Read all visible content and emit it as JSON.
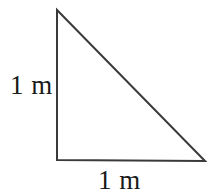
{
  "figure": {
    "kind": "right-triangle-diagram",
    "background_color": "#ffffff",
    "stroke_color": "#3a3a3a",
    "stroke_width": 2,
    "text_color": "#1a1a1a",
    "vertices": {
      "apex": {
        "x": 57,
        "y": 10
      },
      "right_angle": {
        "x": 57,
        "y": 160
      },
      "bottom_right": {
        "x": 205,
        "y": 161
      }
    },
    "edges": {
      "vertical_leg": "57,10 57,160",
      "horizontal_leg": "57,160 205,161",
      "hypotenuse": "57,10 205,161"
    },
    "path": "M 57 10 L 57 160 L 205 161 Z"
  },
  "labels": {
    "vertical_leg": "1 m",
    "horizontal_leg": "1 m"
  }
}
